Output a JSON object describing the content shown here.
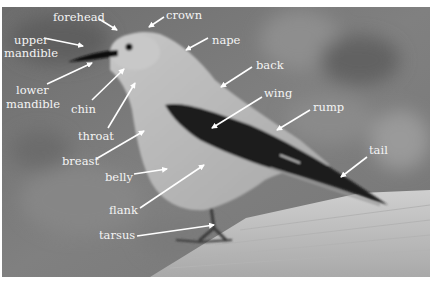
{
  "diagram": {
    "colors": {
      "background": "#7c7c7c",
      "label_text": "#f4f4f4",
      "arrow": "#ffffff",
      "body": "#b9b9b9",
      "wing": "#1e1e1e",
      "rail": "#c2c2c2"
    },
    "labels": [
      {
        "id": "forehead",
        "text": "forehead",
        "x": 53,
        "y": 21,
        "arrow": [
          99,
          19,
          117,
          30
        ]
      },
      {
        "id": "crown",
        "text": "crown",
        "x": 166,
        "y": 19,
        "arrow": [
          164,
          17,
          149,
          27
        ]
      },
      {
        "id": "upper-mandible-1",
        "text": "upper",
        "x": 14,
        "y": 44,
        "arrow": [
          44,
          38,
          83,
          46
        ]
      },
      {
        "id": "upper-mandible-2",
        "text": "mandible",
        "x": 4,
        "y": 57,
        "arrow": null
      },
      {
        "id": "nape",
        "text": "nape",
        "x": 212,
        "y": 44,
        "arrow": [
          208,
          38,
          186,
          50
        ]
      },
      {
        "id": "lower-mandible-1",
        "text": "lower",
        "x": 16,
        "y": 94,
        "arrow": [
          47,
          84,
          92,
          63
        ]
      },
      {
        "id": "lower-mandible-2",
        "text": "mandible",
        "x": 6,
        "y": 108,
        "arrow": null
      },
      {
        "id": "back",
        "text": "back",
        "x": 256,
        "y": 69,
        "arrow": [
          252,
          67,
          221,
          87
        ]
      },
      {
        "id": "chin",
        "text": "chin",
        "x": 71,
        "y": 113,
        "arrow": [
          92,
          100,
          124,
          69
        ]
      },
      {
        "id": "wing",
        "text": "wing",
        "x": 264,
        "y": 97,
        "arrow": [
          262,
          97,
          212,
          128
        ]
      },
      {
        "id": "rump",
        "text": "rump",
        "x": 313,
        "y": 111,
        "arrow": [
          310,
          110,
          277,
          130
        ]
      },
      {
        "id": "throat",
        "text": "throat",
        "x": 78,
        "y": 140,
        "arrow": [
          108,
          128,
          135,
          83
        ]
      },
      {
        "id": "breast",
        "text": "breast",
        "x": 62,
        "y": 165,
        "arrow": [
          96,
          159,
          144,
          131
        ]
      },
      {
        "id": "belly",
        "text": "belly",
        "x": 105,
        "y": 181,
        "arrow": [
          134,
          174,
          167,
          169
        ]
      },
      {
        "id": "tail",
        "text": "tail",
        "x": 369,
        "y": 154,
        "arrow": [
          367,
          157,
          341,
          177
        ]
      },
      {
        "id": "flank",
        "text": "flank",
        "x": 109,
        "y": 214,
        "arrow": [
          140,
          208,
          204,
          165
        ]
      },
      {
        "id": "tarsus",
        "text": "tarsus",
        "x": 99,
        "y": 239,
        "arrow": [
          137,
          236,
          214,
          225
        ]
      }
    ]
  }
}
